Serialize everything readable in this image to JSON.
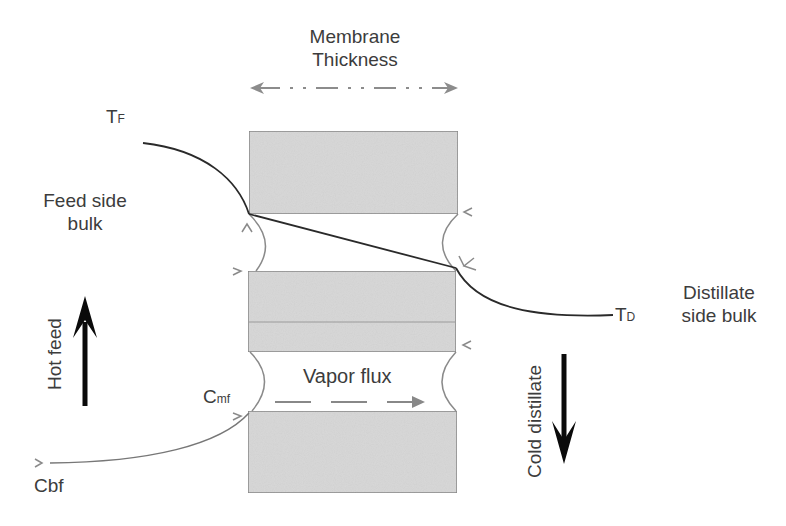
{
  "title": {
    "line1": "Membrane",
    "line2": "Thickness"
  },
  "labels": {
    "tf_main": "T",
    "tf_sub": "F",
    "td_main": "T",
    "td_sub": "D",
    "feed_side_line1": "Feed side",
    "feed_side_line2": "bulk",
    "distillate_line1": "Distillate",
    "distillate_line2": "side bulk",
    "hot_feed": "Hot feed",
    "cold_distillate": "Cold distillate",
    "vapor_flux": "Vapor flux",
    "cmf_main": "C",
    "cmf_sub": "mf",
    "cbf": "Cbf"
  },
  "colors": {
    "membrane_fill": "#d9d9d9",
    "membrane_edge": "#8a8a8a",
    "profile_line": "#2a2a2a",
    "dim_arrow": "#8c8c8c",
    "flow_arrow": "#0a0a0a",
    "text": "#3c3c3c"
  },
  "membrane_blocks": [
    {
      "x": 249,
      "y": 131,
      "w": 209,
      "h": 83
    },
    {
      "x": 248,
      "y": 271,
      "w": 208,
      "h": 81
    },
    {
      "x": 248,
      "y": 411,
      "w": 209,
      "h": 82
    }
  ]
}
